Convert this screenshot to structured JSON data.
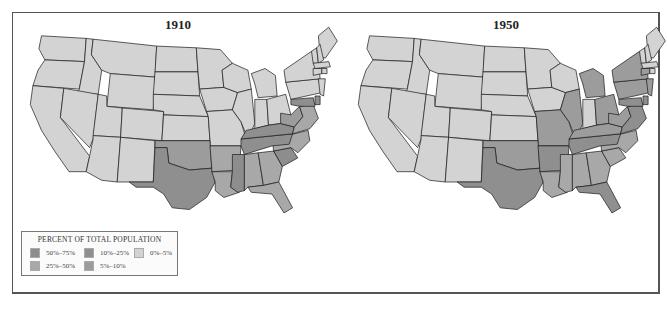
{
  "maps": [
    {
      "title": "1910",
      "states": {
        "WA": "0-5",
        "OR": "0-5",
        "CA": "0-5",
        "ID": "0-5",
        "NV": "0-5",
        "MT": "0-5",
        "WY": "0-5",
        "UT": "0-5",
        "AZ": "0-5",
        "CO": "0-5",
        "NM": "0-5",
        "ND": "0-5",
        "SD": "0-5",
        "NE": "0-5",
        "KS": "0-5",
        "MN": "0-5",
        "IA": "0-5",
        "MO": "0-5",
        "WI": "0-5",
        "IL": "0-5",
        "MI": "0-5",
        "IN": "0-5",
        "OH": "0-5",
        "PA": "0-5",
        "NY": "0-5",
        "ME": "0-5",
        "VT": "0-5",
        "NH": "0-5",
        "MA": "0-5",
        "CT": "0-5",
        "RI": "0-5",
        "NJ": "0-5",
        "OK": "5-10",
        "TX": "10-25",
        "AR": "25-50",
        "LA": "25-50",
        "MS": "50-75",
        "AL": "25-50",
        "GA": "25-50",
        "FL": "25-50",
        "SC": "50-75",
        "NC": "25-50",
        "TN": "10-25",
        "KY": "10-25",
        "WV": "5-10",
        "VA": "25-50",
        "MD": "10-25",
        "DE": "10-25"
      }
    },
    {
      "title": "1950",
      "states": {
        "WA": "0-5",
        "OR": "0-5",
        "CA": "0-5",
        "ID": "0-5",
        "NV": "0-5",
        "MT": "0-5",
        "WY": "0-5",
        "UT": "0-5",
        "AZ": "0-5",
        "CO": "0-5",
        "NM": "0-5",
        "ND": "0-5",
        "SD": "0-5",
        "NE": "0-5",
        "KS": "0-5",
        "MN": "0-5",
        "IA": "0-5",
        "WI": "0-5",
        "IN": "0-5",
        "ME": "0-5",
        "VT": "0-5",
        "NH": "0-5",
        "MO": "5-10",
        "IL": "5-10",
        "MI": "5-10",
        "OH": "5-10",
        "PA": "5-10",
        "NY": "5-10",
        "NJ": "5-10",
        "MA": "0-5",
        "CT": "5-10",
        "RI": "0-5",
        "OK": "5-10",
        "TX": "10-25",
        "AR": "10-25",
        "LA": "25-50",
        "MS": "25-50",
        "AL": "25-50",
        "GA": "25-50",
        "FL": "10-25",
        "SC": "25-50",
        "NC": "25-50",
        "TN": "10-25",
        "KY": "5-10",
        "WV": "5-10",
        "VA": "10-25",
        "MD": "10-25",
        "DE": "10-25"
      }
    }
  ],
  "legend": {
    "title": "PERCENT OF TOTAL POPULATION",
    "items": [
      {
        "key": "50-75",
        "label": "50%–75%",
        "color": "#8e8e8e"
      },
      {
        "key": "25-50",
        "label": "25%–50%",
        "color": "#a9a9a9"
      },
      {
        "key": "10-25",
        "label": "10%–25%",
        "color": "#8a8a8a"
      },
      {
        "key": "5-10",
        "label": "5%–10%",
        "color": "#9a9a9a"
      },
      {
        "key": "0-5",
        "label": "0%–5%",
        "color": "#d4d4d4"
      }
    ]
  },
  "colors": {
    "50-75": "#8d8d8d",
    "25-50": "#a8a8a8",
    "10-25": "#8f8f8f",
    "5-10": "#9c9c9c",
    "0-5": "#d3d3d3",
    "border": "#1a1a1a",
    "frame": "#555555"
  }
}
